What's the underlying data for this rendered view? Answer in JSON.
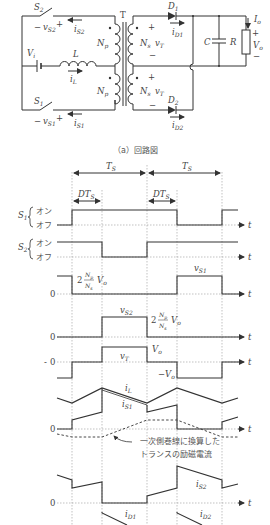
{
  "circuit": {
    "caption": "（a）回路図",
    "transformer_label": "T",
    "source_label": "V",
    "source_sub": "i",
    "inductor_label": "L",
    "inductor_current": "i",
    "inductor_current_sub": "L",
    "switch_top": {
      "label": "S",
      "sub": "2",
      "voltage": "v",
      "voltage_sub": "S2",
      "current": "i",
      "current_sub": "S2"
    },
    "switch_bottom": {
      "label": "S",
      "sub": "1",
      "voltage": "v",
      "voltage_sub": "S1",
      "current": "i",
      "current_sub": "S1"
    },
    "primary_winding": {
      "label": "N",
      "sub": "p"
    },
    "secondary_winding": {
      "label": "N",
      "sub": "s",
      "voltage": "v",
      "voltage_sub": "T"
    },
    "diode_top": {
      "label": "D",
      "sub": "1",
      "current": "i",
      "current_sub": "D1"
    },
    "diode_bottom": {
      "label": "D",
      "sub": "2",
      "current": "i",
      "current_sub": "D2"
    },
    "capacitor_label": "C",
    "resistor_label": "R",
    "output_current": {
      "label": "I",
      "sub": "o"
    },
    "output_voltage": {
      "label": "V",
      "sub": "o"
    },
    "plus": "+",
    "minus": "−"
  },
  "waveforms": {
    "period_label": "T",
    "period_sub": "S",
    "duty_label": "DT",
    "duty_sub": "S",
    "time_axis": "t",
    "zero": "0",
    "on_label": "オン",
    "off_label": "オフ",
    "s1_label": "S",
    "s1_sub": "1",
    "s2_label": "S",
    "s2_sub": "2",
    "vs1_level_coef": "2",
    "vs_level_num": "N",
    "vs_level_num_sub": "p",
    "vs_level_den": "N",
    "vs_level_den_sub": "s",
    "vs_level_v": "V",
    "vs_level_v_sub": "o",
    "vs1_label": "v",
    "vs1_sub": "S1",
    "vs2_label": "v",
    "vs2_sub": "S2",
    "vT_label": "v",
    "vT_sub": "T",
    "vT_pos": "V",
    "vT_pos_sub": "o",
    "vT_neg": "−V",
    "vT_neg_sub": "o",
    "iL_label": "i",
    "iL_sub": "L",
    "iS1_label": "i",
    "iS1_sub": "S1",
    "iS2_label": "i",
    "iS2_sub": "S2",
    "iD1_label": "i",
    "iD1_sub": "D1",
    "iD2_label": "i",
    "iD2_sub": "D2",
    "annotation_line1": "一次側巻線に換算した",
    "annotation_line2": "トランスの励磁電流"
  }
}
